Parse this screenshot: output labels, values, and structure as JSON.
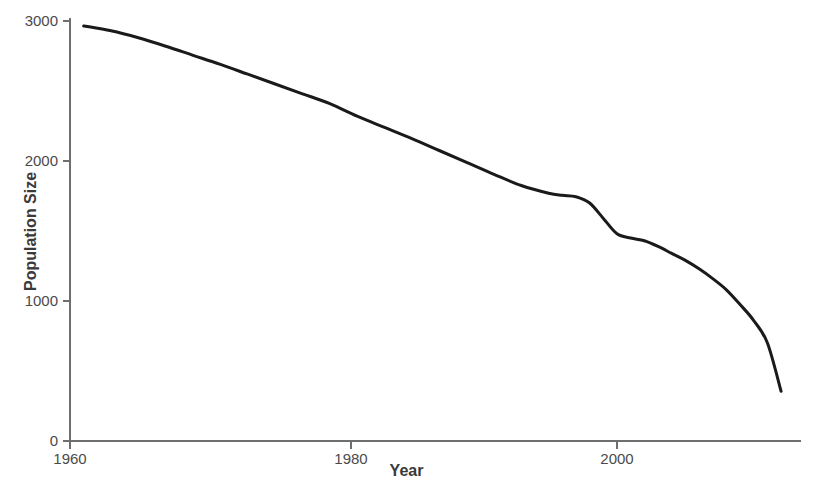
{
  "chart_data": {
    "type": "line",
    "title": "",
    "subtitle": "",
    "xlabel": "Year",
    "ylabel": "Population Size",
    "xlim": [
      1960,
      2013
    ],
    "ylim": [
      0,
      3000
    ],
    "xticks": [
      1960,
      1980,
      2000
    ],
    "xticklabels": [
      "1960",
      "1980",
      "2000"
    ],
    "yticks": [
      0,
      1000,
      2000,
      3000
    ],
    "yticklabels": [
      "0",
      "1000",
      "2000",
      "3000"
    ],
    "grid": false,
    "legend": null,
    "annotations": [],
    "series": [
      {
        "name": "Population Size",
        "color": "#1a1a1a",
        "line_width": 3,
        "x": [
          1961,
          1963,
          1965,
          1967,
          1969,
          1971,
          1973,
          1975,
          1977,
          1979,
          1981,
          1983,
          1985,
          1987,
          1989,
          1991,
          1993,
          1995,
          1996,
          1997,
          1998,
          1999,
          2000,
          2001,
          2002,
          2003,
          2004,
          2005,
          2006,
          2007,
          2008,
          2009,
          2010,
          2011,
          2012
        ],
        "y": [
          2965,
          2930,
          2880,
          2820,
          2755,
          2690,
          2620,
          2550,
          2480,
          2410,
          2320,
          2240,
          2160,
          2075,
          1990,
          1905,
          1825,
          1770,
          1755,
          1745,
          1700,
          1590,
          1480,
          1450,
          1430,
          1390,
          1340,
          1290,
          1230,
          1160,
          1080,
          975,
          860,
          700,
          355
        ]
      }
    ]
  },
  "axes": {
    "y_label": "Population Size",
    "x_label": "Year",
    "y_tick_3000": "3000",
    "y_tick_2000": "2000",
    "y_tick_1000": "1000",
    "y_tick_0": "0",
    "x_tick_1960": "1960",
    "x_tick_1980": "1980",
    "x_tick_2000": "2000"
  },
  "colors": {
    "line": "#1a1a1a",
    "axis": "#666666",
    "tick_text": "#4a4a4a",
    "title_text": "#3a3a3a",
    "background": "#ffffff"
  }
}
